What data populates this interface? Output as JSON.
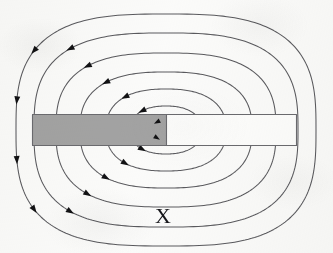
{
  "figure": {
    "type": "physics-field-line-diagram",
    "background_color": "#fbfbfa",
    "line_color": "#5a5a5e",
    "label_color": "#16161a",
    "width": 333,
    "height": 253
  },
  "labels": {
    "x_label": "X"
  },
  "bar": {
    "name": "magnet-bar",
    "left": 32,
    "top": 114,
    "right": 297,
    "bottom": 146,
    "border_color": "#6b6b6f",
    "shaded_section": {
      "label": "",
      "fill_color": "#a3a3a3",
      "left": 32,
      "right": 166
    },
    "open_section": {
      "label": "",
      "fill_color": "#fdfdfc",
      "left": 166,
      "right": 297
    }
  },
  "chart_data": {
    "type": "line",
    "xlabel": "",
    "ylabel": "",
    "annotations": [
      "X"
    ],
    "flow_direction": "counterclockwise",
    "loop_count": 6,
    "center_x": 166,
    "center_y": 130,
    "loops": [
      {
        "index": 1,
        "rx": 14,
        "ry": 10,
        "arrowheads": 2
      },
      {
        "index": 2,
        "rx": 36,
        "ry": 24,
        "arrowheads": 2
      },
      {
        "index": 3,
        "rx": 60,
        "ry": 41,
        "arrowheads": 2
      },
      {
        "index": 4,
        "rx": 86,
        "ry": 58,
        "arrowheads": 2
      },
      {
        "index": 5,
        "rx": 110,
        "ry": 77,
        "arrowheads": 2
      },
      {
        "index": 6,
        "rx": 132,
        "ry": 97,
        "arrowheads": 2
      },
      {
        "index": 7,
        "rx": 150,
        "ry": 116,
        "arrowheads": 2
      }
    ],
    "arrow_direction": "down-left",
    "grid": false,
    "legend": "none"
  }
}
